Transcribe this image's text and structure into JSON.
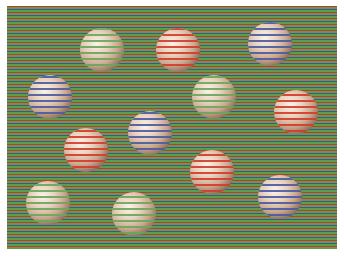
{
  "colors": {
    "background_stripes": [
      "#c0392b",
      "#5e9e4a",
      "#4a4f9a",
      "#5e9e4a"
    ],
    "sphere_base": "#e8d2bf",
    "stripe_red": "#d43a2a",
    "stripe_green": "#6aa65a",
    "stripe_blue": "#4a5aa0"
  },
  "spheres": [
    {
      "id": 1,
      "cx": 95,
      "cy": 44,
      "r": 22,
      "apparent_color": "green"
    },
    {
      "id": 2,
      "cx": 171,
      "cy": 44,
      "r": 22,
      "apparent_color": "red"
    },
    {
      "id": 3,
      "cx": 263,
      "cy": 38,
      "r": 22,
      "apparent_color": "blue"
    },
    {
      "id": 4,
      "cx": 43,
      "cy": 91,
      "r": 22,
      "apparent_color": "blue"
    },
    {
      "id": 5,
      "cx": 207,
      "cy": 91,
      "r": 22,
      "apparent_color": "green"
    },
    {
      "id": 6,
      "cx": 289,
      "cy": 106,
      "r": 22,
      "apparent_color": "red"
    },
    {
      "id": 7,
      "cx": 79,
      "cy": 144,
      "r": 22,
      "apparent_color": "red"
    },
    {
      "id": 8,
      "cx": 143,
      "cy": 127,
      "r": 22,
      "apparent_color": "blue"
    },
    {
      "id": 9,
      "cx": 205,
      "cy": 166,
      "r": 22,
      "apparent_color": "red"
    },
    {
      "id": 10,
      "cx": 41,
      "cy": 197,
      "r": 22,
      "apparent_color": "green"
    },
    {
      "id": 11,
      "cx": 127,
      "cy": 208,
      "r": 22,
      "apparent_color": "green"
    },
    {
      "id": 12,
      "cx": 273,
      "cy": 191,
      "r": 22,
      "apparent_color": "blue"
    }
  ]
}
